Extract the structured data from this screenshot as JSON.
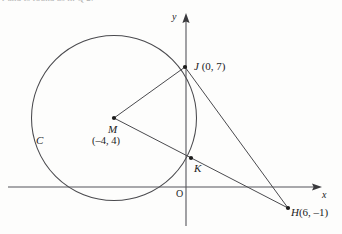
{
  "figure": {
    "kind": "coordinate-geometry-diagram",
    "background_color": "#fdfdfc",
    "ink_color": "#2b2b2b",
    "cut_off_caption": "r and is found as in Q 2."
  },
  "axes": {
    "x_label": "x",
    "y_label": "y",
    "origin_label": "O",
    "x_axis_pixel_y": 187,
    "y_axis_pixel_x": 186,
    "units_per_pixel_x": 18,
    "units_per_pixel_y": 17
  },
  "circle": {
    "name_label": "C",
    "center_point": "M",
    "center_coords_label": "(–4, 4)",
    "center_x": -4,
    "center_y": 4,
    "radius": 5
  },
  "points": [
    {
      "id": "J",
      "label": "J",
      "coords_label": "(0, 7)",
      "x": 0,
      "y": 7,
      "marker": true
    },
    {
      "id": "M",
      "label": "M",
      "coords_label": "(–4, 4)",
      "x": -4,
      "y": 4,
      "marker": true
    },
    {
      "id": "K",
      "label": "K",
      "coords_label": "",
      "x": 0.3,
      "y": 1.7,
      "marker": true
    },
    {
      "id": "H",
      "label": "H",
      "coords_label": "(6, –1)",
      "x": 6,
      "y": -1,
      "marker": true
    }
  ],
  "segments": [
    {
      "id": "MJ",
      "from": "M",
      "to": "J"
    },
    {
      "id": "MH",
      "from": "M",
      "to": "H"
    },
    {
      "id": "JH",
      "from": "J",
      "to": "H"
    }
  ],
  "labels": {
    "J": "J",
    "J_coords": "(0, 7)",
    "M": "M",
    "M_coords": "(–4, 4)",
    "K": "K",
    "H": "H",
    "H_coords": "(6, –1)",
    "C": "C",
    "O": "O",
    "x": "x",
    "y": "y"
  }
}
